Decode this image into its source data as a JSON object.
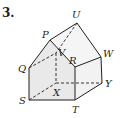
{
  "problem_number": "3.",
  "figure": {
    "type": "pentagonal prism (house-shaped solid)",
    "vertices": {
      "U": {
        "label": "U",
        "x": 77,
        "y": 23
      },
      "P": {
        "label": "P",
        "x": 50,
        "y": 40
      },
      "W": {
        "label": "W",
        "x": 101,
        "y": 57
      },
      "R": {
        "label": "R",
        "x": 75,
        "y": 67
      },
      "Q": {
        "label": "Q",
        "x": 29,
        "y": 68
      },
      "V": {
        "label": "V",
        "x": 56,
        "y": 53
      },
      "S": {
        "label": "S",
        "x": 29,
        "y": 100
      },
      "T": {
        "label": "T",
        "x": 75,
        "y": 100
      },
      "X": {
        "label": "X",
        "x": 56,
        "y": 83
      },
      "Y": {
        "label": "Y",
        "x": 102,
        "y": 83
      }
    },
    "colors": {
      "stroke": "#231f20",
      "front_face": "#ececec",
      "right_face": "#f3f3f3",
      "roof_face": "#f7f7f7"
    }
  }
}
